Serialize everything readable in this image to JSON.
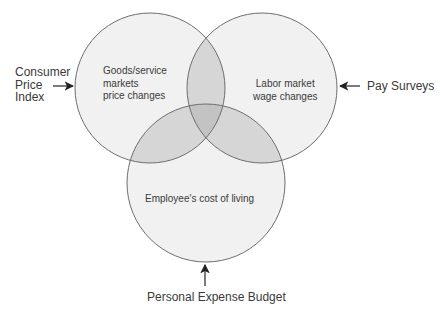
{
  "diagram": {
    "type": "venn",
    "top_cropped_text": "·",
    "colors": {
      "single_fill": "#f1f1f1",
      "pair_fill": "#d6d6d6",
      "triple_fill": "#c3c3c3",
      "stroke": "#6e6e6e",
      "arrow": "#222222"
    },
    "circles": [
      {
        "id": "goods",
        "lines": [
          "Goods/service",
          "markets",
          "price changes"
        ]
      },
      {
        "id": "labor",
        "lines": [
          "Labor market",
          "wage changes"
        ]
      },
      {
        "id": "living",
        "lines": [
          "Employee's cost of living"
        ]
      }
    ],
    "sources": {
      "left": {
        "lines": [
          "Consumer",
          "Price",
          "Index"
        ]
      },
      "right": {
        "label": "Pay Surveys"
      },
      "bottom": {
        "label": "Personal Expense Budget"
      }
    }
  }
}
